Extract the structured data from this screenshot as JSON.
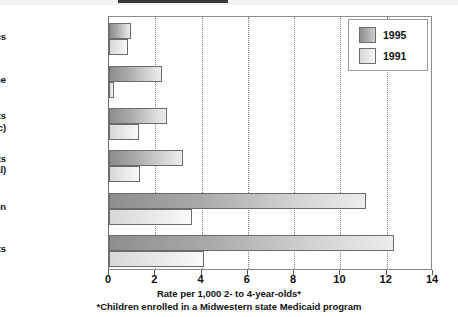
{
  "chart_data": {
    "type": "bar",
    "orientation": "horizontal",
    "title": "",
    "xlabel": "Rate per 1,000 2- to 4-year-olds*",
    "ylabel": "",
    "footnote": "*Children enrolled in a Midwestern state Medicaid program",
    "categories": [
      "Neuroleptics",
      "Clonidine",
      "Antidepressants\n(Tricyclic)",
      "Antidepressants\n(Total)",
      "Ritalin",
      "Stimulants"
    ],
    "series": [
      {
        "name": "1995",
        "values": [
          0.95,
          2.3,
          2.5,
          3.2,
          11.1,
          12.3
        ]
      },
      {
        "name": "1991",
        "values": [
          0.8,
          0.2,
          1.3,
          1.35,
          3.6,
          4.1
        ]
      }
    ],
    "xlim": [
      0,
      14
    ],
    "xticks": [
      0,
      2,
      4,
      6,
      8,
      10,
      12,
      14
    ],
    "xtick_labels": [
      "0",
      "2",
      "4",
      "6",
      "8",
      "10",
      "12",
      "14"
    ],
    "grid": true,
    "grid_axis": "x",
    "grid_style": "dotted",
    "legend_position": "top-right",
    "colors": {
      "series_1995_dark": "#8d8d8d",
      "series_1995_light": "#ececec",
      "series_1991_dark": "#d8d8d8",
      "series_1991_light": "#fafafa",
      "bar_border": "#6b6b6b",
      "frame": "#8c8c8c",
      "gridline": "#7d7d7d",
      "text": "#111111",
      "background": "#ffffff"
    }
  }
}
